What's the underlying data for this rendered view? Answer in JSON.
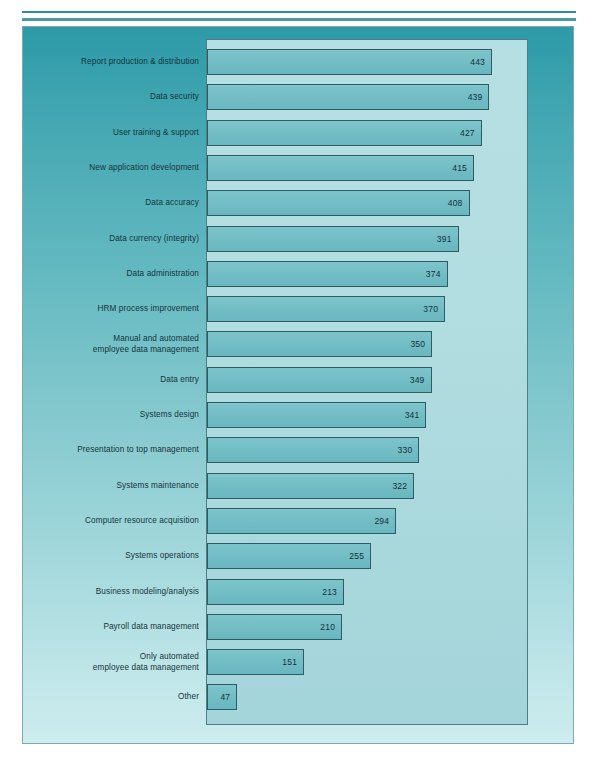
{
  "chart_data": {
    "type": "bar",
    "orientation": "horizontal",
    "title": "",
    "subtitle": "",
    "xlabel": "",
    "ylabel": "",
    "grid": false,
    "legend": null,
    "xlim": [
      0,
      460
    ],
    "value_labels_inside_bars": true,
    "categories": [
      "Report production & distribution",
      "Data security",
      "User training & support",
      "New application development",
      "Data accuracy",
      "Data currency (integrity)",
      "Data administration",
      "HRM process improvement",
      "Manual and automated\nemployee data management",
      "Data entry",
      "Systems design",
      "Presentation to top management",
      "Systems maintenance",
      "Computer resource acquisition",
      "Systems operations",
      "Business modeling/analysis",
      "Payroll data management",
      "Only automated\nemployee data management",
      "Other"
    ],
    "values": [
      443,
      439,
      427,
      415,
      408,
      391,
      374,
      370,
      350,
      349,
      341,
      330,
      322,
      294,
      255,
      213,
      210,
      151,
      47
    ]
  },
  "colors": {
    "background_top": "#2d9aa8",
    "background_bottom": "#cdecee",
    "plot_area": "#abd9dd",
    "bar_fill": "#74bec6",
    "bar_border": "#2d5c63",
    "rule": "#2e8f99",
    "text": "#15343a"
  }
}
